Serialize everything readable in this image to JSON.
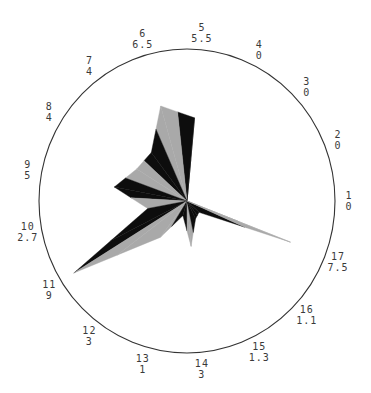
{
  "chart_data": {
    "type": "radar",
    "title": "",
    "categories": [
      "1",
      "2",
      "3",
      "4",
      "5",
      "6",
      "7",
      "8",
      "9",
      "10",
      "11",
      "12",
      "13",
      "14",
      "15",
      "16",
      "17"
    ],
    "values": [
      0,
      0,
      0,
      0,
      5.5,
      6.5,
      4,
      4,
      5,
      2.7,
      9,
      3,
      1,
      3,
      1.3,
      1.1,
      7.5
    ],
    "value_max": 10,
    "start_angle_deg": 0,
    "direction": "counterclockwise",
    "outer_circle": true,
    "grid": false,
    "legend": null,
    "colors": {
      "B": "#0d0d0d",
      "G": "#a9a9a9",
      "circle": "#333333"
    },
    "fill_pattern": [
      [
        "G",
        "G"
      ],
      [
        "G",
        "G"
      ],
      [
        "G",
        "G"
      ],
      [
        "G",
        "G"
      ],
      [
        "B",
        "B"
      ],
      [
        "G",
        "G"
      ],
      [
        "B",
        "B"
      ],
      [
        "G",
        "G"
      ],
      [
        "B",
        "B"
      ],
      [
        "G",
        "B"
      ],
      [
        "B",
        "G"
      ],
      [
        "G",
        "G"
      ],
      [
        "B",
        "B"
      ],
      [
        "G",
        "G"
      ],
      [
        "B",
        "B"
      ],
      [
        "B",
        "B"
      ],
      [
        "G",
        "G"
      ]
    ]
  },
  "spoke_labels": [
    {
      "index": "1",
      "value": "0"
    },
    {
      "index": "2",
      "value": "0"
    },
    {
      "index": "3",
      "value": "0"
    },
    {
      "index": "4",
      "value": "0"
    },
    {
      "index": "5",
      "value": "5.5"
    },
    {
      "index": "6",
      "value": "6.5"
    },
    {
      "index": "7",
      "value": "4"
    },
    {
      "index": "8",
      "value": "4"
    },
    {
      "index": "9",
      "value": "5"
    },
    {
      "index": "10",
      "value": "2.7"
    },
    {
      "index": "11",
      "value": "9"
    },
    {
      "index": "12",
      "value": "3"
    },
    {
      "index": "13",
      "value": "1"
    },
    {
      "index": "14",
      "value": "3"
    },
    {
      "index": "15",
      "value": "1.3"
    },
    {
      "index": "16",
      "value": "1.1"
    },
    {
      "index": "17",
      "value": "7.5"
    }
  ]
}
